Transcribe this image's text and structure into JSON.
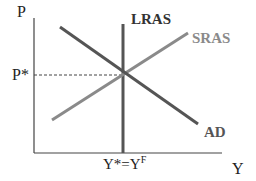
{
  "diagram": {
    "type": "AD-AS model (long-run equilibrium)",
    "axes": {
      "y_label": "P",
      "x_label": "Y"
    },
    "markers": {
      "price_level": "P*",
      "output_label_main": "Y*=Y",
      "output_label_sup": "F"
    },
    "curves": [
      {
        "name": "LRAS",
        "label": "LRAS",
        "color": "#555555",
        "shape": "vertical"
      },
      {
        "name": "SRAS",
        "label": "SRAS",
        "color": "#8a8a8a",
        "shape": "upward-sloping"
      },
      {
        "name": "AD",
        "label": "AD",
        "color": "#555555",
        "shape": "downward-sloping"
      }
    ],
    "equilibrium": {
      "price": "P*",
      "output": "Y*=Y^F"
    }
  }
}
